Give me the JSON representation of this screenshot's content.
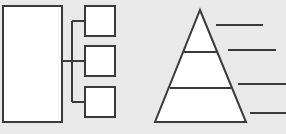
{
  "canvas": {
    "width": 286,
    "height": 134,
    "background_color": "#e9e9e9",
    "shape_fill_color": "#ffffff",
    "stroke_color": "#3a3a3a",
    "stroke_width": 2
  },
  "left_diagram": {
    "name": "block-diagram-with-three-branches",
    "main_block": {
      "label": "",
      "x": 3,
      "y": 6,
      "width": 59,
      "height": 116
    },
    "bus_line": {
      "x": 72,
      "y_top": 21,
      "y_bottom": 102
    },
    "branch_boxes": [
      {
        "label": "",
        "x": 85,
        "y": 6,
        "width": 30,
        "height": 30,
        "connector_y": 21
      },
      {
        "label": "",
        "x": 85,
        "y": 46,
        "width": 30,
        "height": 30,
        "connector_y": 61
      },
      {
        "label": "",
        "x": 85,
        "y": 87,
        "width": 30,
        "height": 30,
        "connector_y": 102
      }
    ]
  },
  "right_diagram": {
    "name": "three-tier-pyramid-with-callouts",
    "pyramid": {
      "apex_x": 200,
      "apex_y": 10,
      "base_left_x": 155,
      "base_right_x": 246,
      "base_y": 122,
      "dividers": [
        {
          "y": 52,
          "x1": 184,
          "x2": 217
        },
        {
          "y": 88,
          "x1": 170,
          "x2": 231
        }
      ],
      "tiers": [
        {
          "label": "",
          "level": 1
        },
        {
          "label": "",
          "level": 2
        },
        {
          "label": "",
          "level": 3
        }
      ]
    },
    "callout_lines": [
      {
        "label": "",
        "y": 25,
        "x1": 216,
        "x2": 263
      },
      {
        "label": "",
        "y": 50,
        "x1": 228,
        "x2": 276
      },
      {
        "label": "",
        "y": 84,
        "x1": 238,
        "x2": 286
      },
      {
        "label": "",
        "y": 113,
        "x1": 250,
        "x2": 286
      }
    ]
  }
}
